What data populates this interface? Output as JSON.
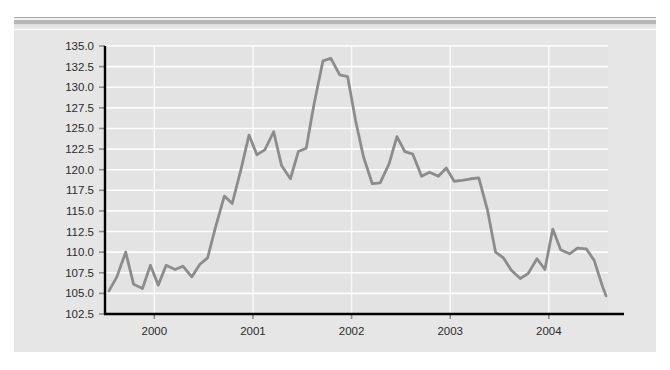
{
  "figure": {
    "background_color": "#e6e6e6",
    "plot_background_color": "#e3e3e3",
    "page_background_color": "#ffffff",
    "top_band": {
      "name": "decorative-rule",
      "thin_rule_color": "#a9a9a9",
      "thick_rule_color": "#b6b6b6"
    }
  },
  "chart_data": {
    "type": "line",
    "title": "",
    "subtitle": "",
    "xlabel": "",
    "ylabel": "",
    "grid": true,
    "legend": "none",
    "line_color": "#8c8c8c",
    "axis_color": "#000000",
    "gridline_color": "#ffffff",
    "xlim": [
      1999.5,
      2004.6
    ],
    "ylim": [
      102.5,
      135.0
    ],
    "ytick_labels": [
      "102.5",
      "105.0",
      "107.5",
      "110.0",
      "112.5",
      "115.0",
      "117.5",
      "120.0",
      "122.5",
      "125.0",
      "127.5",
      "130.0",
      "132.5",
      "135.0"
    ],
    "yticks": [
      102.5,
      105.0,
      107.5,
      110.0,
      112.5,
      115.0,
      117.5,
      120.0,
      122.5,
      125.0,
      127.5,
      130.0,
      132.5,
      135.0
    ],
    "xtick_labels": [
      "2000",
      "2001",
      "2002",
      "2003",
      "2004"
    ],
    "xticks": [
      2000,
      2001,
      2002,
      2003,
      2004
    ],
    "series": [
      {
        "name": "index",
        "x": [
          1999.54,
          1999.62,
          1999.71,
          1999.79,
          1999.88,
          1999.96,
          2000.04,
          2000.12,
          2000.21,
          2000.29,
          2000.38,
          2000.46,
          2000.54,
          2000.62,
          2000.71,
          2000.79,
          2000.88,
          2000.96,
          2001.04,
          2001.12,
          2001.21,
          2001.29,
          2001.38,
          2001.46,
          2001.54,
          2001.62,
          2001.71,
          2001.79,
          2001.88,
          2001.96,
          2002.04,
          2002.12,
          2002.21,
          2002.29,
          2002.38,
          2002.46,
          2002.54,
          2002.62,
          2002.71,
          2002.79,
          2002.88,
          2002.96,
          2003.04,
          2003.12,
          2003.21,
          2003.29,
          2003.38,
          2003.46,
          2003.54,
          2003.62,
          2003.71,
          2003.79,
          2003.88,
          2003.96,
          2004.04,
          2004.12,
          2004.21,
          2004.29,
          2004.38,
          2004.46,
          2004.54,
          2004.58
        ],
        "y": [
          105.3,
          107.0,
          110.0,
          106.1,
          105.6,
          108.4,
          106.0,
          108.4,
          107.9,
          108.3,
          107.0,
          108.5,
          109.3,
          113.0,
          116.8,
          115.9,
          120.1,
          124.2,
          121.8,
          122.4,
          124.6,
          120.5,
          118.9,
          122.2,
          122.6,
          128.0,
          133.2,
          133.5,
          131.5,
          131.3,
          126.0,
          121.6,
          118.3,
          118.4,
          120.7,
          124.0,
          122.2,
          121.9,
          119.2,
          119.7,
          119.2,
          120.2,
          118.6,
          118.7,
          118.9,
          119.0,
          115.0,
          110.0,
          109.3,
          107.8,
          106.8,
          107.4,
          109.2,
          107.9,
          112.8,
          110.3,
          109.8,
          110.5,
          110.4,
          109.0,
          106.0,
          104.7
        ]
      }
    ]
  }
}
